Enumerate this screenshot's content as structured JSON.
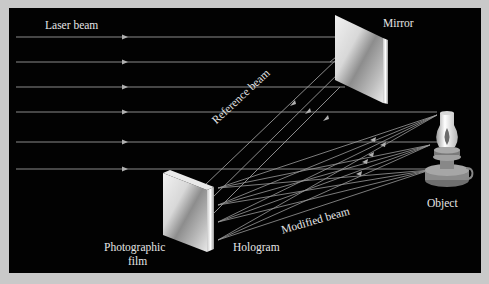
{
  "diagram": {
    "labels": {
      "laser_beam": "Laser beam",
      "mirror": "Mirror",
      "reference_beam": "Reference beam",
      "object": "Object",
      "modified_beam": "Modified beam",
      "photographic_film_line1": "Photographic",
      "photographic_film_line2": "film",
      "hologram": "Hologram"
    },
    "components": [
      "laser beam",
      "mirror",
      "object (oil lamp)",
      "photographic film / hologram"
    ],
    "colors": {
      "background": "#c9c9c9",
      "panel": "#020202",
      "beam": "#9a9a9a",
      "text": "#e6e6e6"
    }
  }
}
